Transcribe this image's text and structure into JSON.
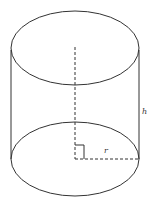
{
  "diagram": {
    "labels": {
      "height": "h",
      "radius": "r"
    },
    "colors": {
      "stroke": "#333333",
      "background": "#ffffff"
    }
  }
}
